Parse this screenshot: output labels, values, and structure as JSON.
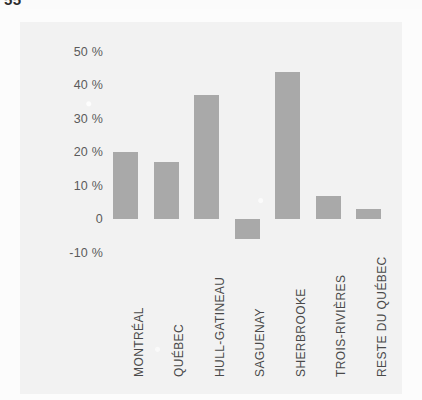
{
  "header": {
    "page_number": "55",
    "running_title": "",
    "cropped": true
  },
  "chart_data": {
    "type": "bar",
    "title": "",
    "subtitle": "",
    "xlabel": "",
    "ylabel": "",
    "categories": [
      "MONTRÉAL",
      "QUÉBEC",
      "HULL-GATINEAU",
      "SAGUENAY",
      "SHERBROOKE",
      "TROIS-RIVIÈRES",
      "RESTE DU QUÉBEC"
    ],
    "values": [
      20,
      17,
      37,
      -6,
      44,
      7,
      3
    ],
    "value_labels": [
      "20 %",
      "17 %",
      "37 %",
      "-6 %",
      "44 %",
      "7 %",
      "3 %"
    ],
    "ylim": [
      -10,
      50
    ],
    "yticks": [
      50,
      40,
      30,
      20,
      10,
      0,
      -10
    ],
    "ytick_labels": [
      "50 %",
      "40 %",
      "30 %",
      "20 %",
      "10 %",
      "0",
      "-10 %"
    ],
    "grid": false,
    "legend": "none",
    "bar_color": "#a9a9a9",
    "background_color": "#f2f2f2",
    "axis_text_color": "#4a4a4a"
  }
}
